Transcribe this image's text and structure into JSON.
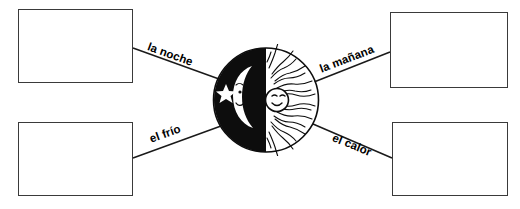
{
  "worksheet": {
    "title": "Vocabulario: el dia y la noche",
    "background_color": "#ffffff",
    "ink_color": "#000000"
  },
  "central_figure": {
    "name": "sun-moon-split-circle",
    "description": "Oval split vertically: black night half with crescent moon and star, white day half with rayed sun face",
    "night_half": {
      "fill_color": "#0d0d0d",
      "icons": [
        "crescent-moon-with-face",
        "five-pointed-star"
      ]
    },
    "day_half": {
      "fill_color": "#ffffff",
      "icons": [
        "sun-with-face",
        "wavy-rays"
      ]
    }
  },
  "connectors": [
    {
      "id": "noche",
      "label": "la noche",
      "box_position": "top-left",
      "rotation_deg": 20
    },
    {
      "id": "manana",
      "label": "la mañana",
      "box_position": "top-right",
      "rotation_deg": -21
    },
    {
      "id": "frio",
      "label": "el frío",
      "box_position": "bottom-left",
      "rotation_deg": -20
    },
    {
      "id": "calor",
      "label": "el calor",
      "box_position": "bottom-right",
      "rotation_deg": 22
    }
  ],
  "answer_boxes": [
    {
      "id": "box-top-left",
      "value": "",
      "placeholder": ""
    },
    {
      "id": "box-top-right",
      "value": "",
      "placeholder": ""
    },
    {
      "id": "box-bottom-left",
      "value": "",
      "placeholder": ""
    },
    {
      "id": "box-bottom-right",
      "value": "",
      "placeholder": ""
    }
  ]
}
